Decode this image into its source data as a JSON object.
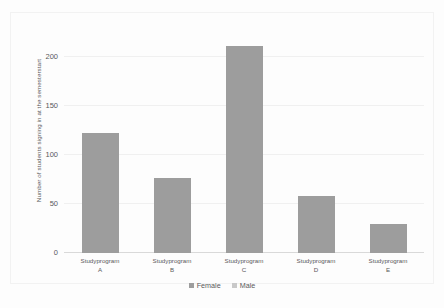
{
  "chart_data": {
    "type": "bar",
    "title": "",
    "subtitle": "",
    "categories": [
      "Studyprogram A",
      "Studyprogram B",
      "Studyprogram C",
      "Studyprogram D",
      "Studyprogram E"
    ],
    "category_lines": [
      [
        "Studyprogram",
        "A"
      ],
      [
        "Studyprogram",
        "B"
      ],
      [
        "Studyprogram",
        "C"
      ],
      [
        "Studyprogram",
        "D"
      ],
      [
        "Studyprogram",
        "E"
      ]
    ],
    "values": [
      123,
      77,
      212,
      58,
      30
    ],
    "series": [
      {
        "name": "Female",
        "color": "#9d9d9d",
        "values": [
          123,
          77,
          212,
          58,
          30
        ]
      },
      {
        "name": "Male",
        "color": "#c9c9c9",
        "values": [
          0,
          0,
          0,
          0,
          0
        ]
      }
    ],
    "xlabel": "",
    "ylabel": "Number of students signing in at the semesterstart",
    "ylim": [
      0,
      225
    ],
    "yticks": [
      0,
      50,
      100,
      150,
      200
    ],
    "ytick_labels": [
      "0",
      "50",
      "100",
      "150",
      "200"
    ],
    "grid": true,
    "legend_position": "bottom",
    "legend": [
      "Female",
      "Male"
    ]
  },
  "colors": {
    "bar": "#9d9d9d",
    "legend_female": "#9d9d9d",
    "legend_male": "#c9c9c9",
    "gridline": "#f0f0f0",
    "baseline": "#d9d9d9",
    "text": "#59595b",
    "background": "#fdfdfd"
  }
}
